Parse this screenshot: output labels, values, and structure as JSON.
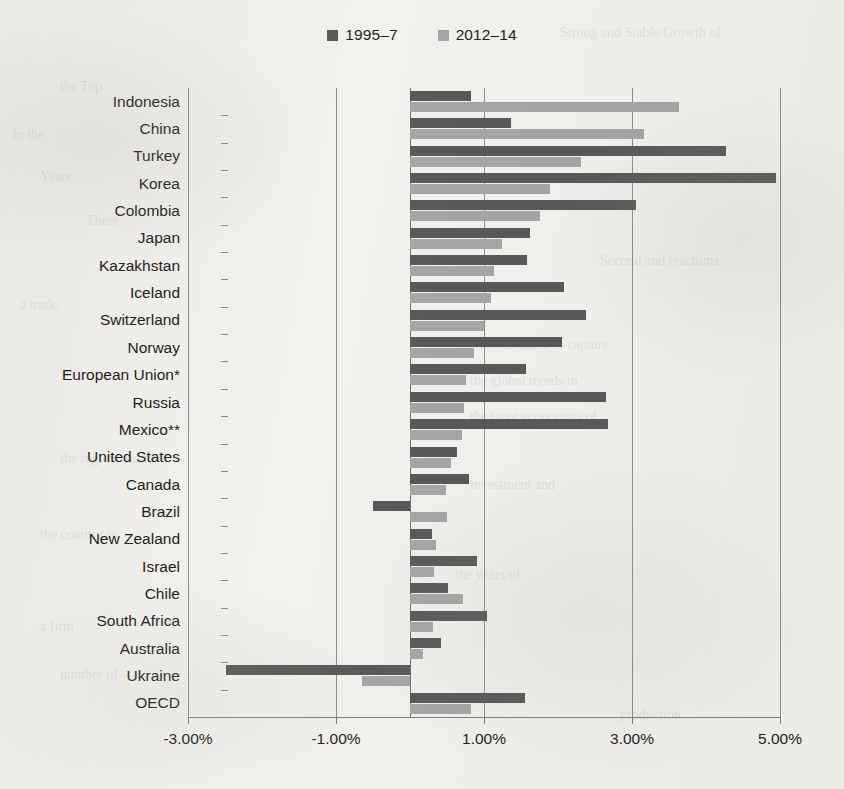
{
  "legend": {
    "items": [
      {
        "label": "1995–7",
        "color": "#595959",
        "swatch_name": "legend-swatch-dark"
      },
      {
        "label": "2012–14",
        "color": "#a6a6a6",
        "swatch_name": "legend-swatch-light"
      }
    ]
  },
  "axis": {
    "tick_labels": [
      "-3.00%",
      "-1.00%",
      "1.00%",
      "3.00%",
      "5.00%"
    ],
    "tick_values": [
      -3,
      -1,
      1,
      3,
      5
    ]
  },
  "chart_data": {
    "type": "bar",
    "orientation": "horizontal",
    "title": "",
    "subtitle": "",
    "xlabel": "",
    "ylabel": "",
    "xlim": [
      -3.0,
      5.0
    ],
    "grid": true,
    "legend_position": "top-center",
    "value_format": "percent",
    "categories": [
      "Indonesia",
      "China",
      "Turkey",
      "Korea",
      "Colombia",
      "Japan",
      "Kazakhstan",
      "Iceland",
      "Switzerland",
      "Norway",
      "European Union*",
      "Russia",
      "Mexico**",
      "United States",
      "Canada",
      "Brazil",
      "New Zealand",
      "Israel",
      "Chile",
      "South Africa",
      "Australia",
      "Ukraine",
      "OECD"
    ],
    "series": [
      {
        "name": "1995–7",
        "color": "#595959",
        "values": [
          0.82,
          1.37,
          4.27,
          4.95,
          3.05,
          1.62,
          1.58,
          2.08,
          2.38,
          2.05,
          1.57,
          2.65,
          2.68,
          0.63,
          0.8,
          -0.5,
          0.3,
          0.91,
          0.51,
          1.04,
          0.42,
          -2.49,
          1.55
        ]
      },
      {
        "name": "2012–14",
        "color": "#a6a6a6",
        "values": [
          3.64,
          3.16,
          2.31,
          1.89,
          1.76,
          1.24,
          1.14,
          1.09,
          1.0,
          0.86,
          0.76,
          0.73,
          0.7,
          0.55,
          0.48,
          0.5,
          0.35,
          0.32,
          0.72,
          0.31,
          0.17,
          -0.65,
          0.82
        ]
      }
    ]
  },
  "background_text": {
    "lines": [
      "Strong and Stable Growth of",
      "the Top",
      "In the",
      "Years",
      "There",
      "Second and reactions",
      "a trade",
      "are not sufficient to capture",
      "the global trends in",
      "the large economies of",
      "the region and its",
      "investment and",
      "the country in",
      "the years of",
      "a firm",
      "number of",
      "production"
    ]
  }
}
